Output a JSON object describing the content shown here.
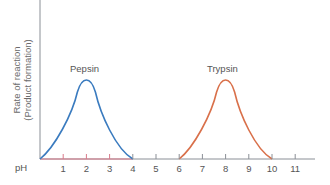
{
  "chart_data": {
    "type": "line",
    "title": "",
    "xlabel": "pH",
    "ylabel": "Rate of reaction (Product formation)",
    "ylabel_lines": [
      "Rate of reaction",
      "(Product formation)"
    ],
    "x_ticks": [
      1,
      2,
      3,
      4,
      5,
      6,
      7,
      8,
      9,
      10,
      11
    ],
    "xlim": [
      0,
      12
    ],
    "ylim": [
      0,
      1
    ],
    "grid": false,
    "legend": "none (inline labels)",
    "series": [
      {
        "name": "Pepsin",
        "color": "#3a7bbf",
        "x": [
          0,
          0.5,
          1,
          1.5,
          2,
          2.5,
          3,
          3.5,
          4
        ],
        "y": [
          0,
          0.2,
          0.45,
          0.9,
          1.0,
          0.9,
          0.45,
          0.15,
          0
        ],
        "optimum_pH": 2,
        "label_position": [
          2,
          1.12
        ]
      },
      {
        "name": "Trypsin",
        "color": "#d9704a",
        "x": [
          6,
          6.5,
          7,
          7.5,
          8,
          8.5,
          9,
          9.5,
          10
        ],
        "y": [
          0,
          0.2,
          0.45,
          0.9,
          1.0,
          0.9,
          0.45,
          0.15,
          0
        ],
        "optimum_pH": 8,
        "label_position": [
          8,
          1.12
        ]
      }
    ],
    "annotations": [
      {
        "text": "Pepsin",
        "x": 2,
        "y": 1.12
      },
      {
        "text": "Trypsin",
        "x": 8,
        "y": 1.12
      }
    ],
    "axis_highlight": {
      "from": 0,
      "to": 4,
      "color": "#d97a8a"
    }
  },
  "labels": {
    "ylabel_line1": "Rate of reaction",
    "ylabel_line2": "(Product formation)",
    "xlabel": "pH",
    "pepsin": "Pepsin",
    "trypsin": "Trypsin"
  },
  "colors": {
    "axis": "#8a8f96",
    "pepsin": "#3a7bbf",
    "trypsin": "#d9704a",
    "axis_highlight": "#d97a8a",
    "text": "#555555"
  }
}
